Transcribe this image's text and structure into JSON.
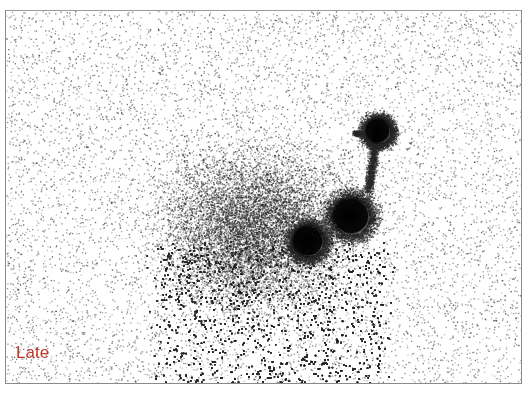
{
  "image": {
    "kind": "scintigraphy-scan",
    "label": "Late",
    "label_color": "#c0392b",
    "hotspots": [
      {
        "name": "hotspot-lower-left",
        "cx": 302,
        "cy": 230,
        "r": 15
      },
      {
        "name": "hotspot-middle",
        "cx": 345,
        "cy": 205,
        "r": 18
      },
      {
        "name": "hotspot-upper",
        "cx": 372,
        "cy": 120,
        "r": 12
      }
    ]
  }
}
